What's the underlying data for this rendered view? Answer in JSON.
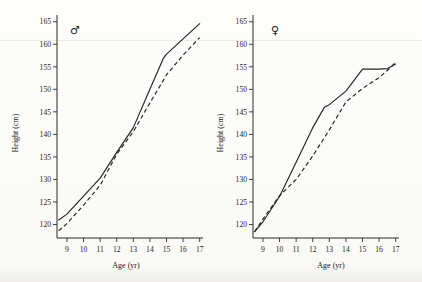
{
  "figure": {
    "background_color": "#fdfdfb",
    "line_color": "#242424"
  },
  "panels": [
    {
      "id": "male",
      "symbol": "♂",
      "symbol_name": "mars-symbol",
      "xlabel": "Age (yr)",
      "ylabel": "Height (cm)",
      "xticks": [
        "9",
        "10",
        "11",
        "12",
        "13",
        "14",
        "15",
        "16",
        "17"
      ],
      "yticks": [
        "120",
        "125",
        "130",
        "135",
        "140",
        "145",
        "150",
        "155",
        "160",
        "165"
      ]
    },
    {
      "id": "female",
      "symbol": "♀",
      "symbol_name": "venus-symbol",
      "xlabel": "Age (yr)",
      "ylabel": "Height (cm)",
      "xticks": [
        "9",
        "10",
        "11",
        "12",
        "13",
        "14",
        "15",
        "16",
        "17"
      ],
      "yticks": [
        "120",
        "125",
        "130",
        "135",
        "140",
        "145",
        "150",
        "155",
        "160",
        "165"
      ]
    }
  ],
  "chart_data": [
    {
      "type": "line",
      "title": "Male growth curve",
      "panel": "male",
      "symbol": "♂",
      "xlabel": "Age (yr)",
      "ylabel": "Height (cm)",
      "xlim": [
        8.4,
        17.2
      ],
      "ylim": [
        117.0,
        166.5
      ],
      "xticks": [
        9,
        10,
        11,
        12,
        13,
        14,
        15,
        16,
        17
      ],
      "yticks": [
        120,
        125,
        130,
        135,
        140,
        145,
        150,
        155,
        160,
        165
      ],
      "grid": false,
      "legend": "none",
      "series": [
        {
          "name": "solid",
          "style": "solid",
          "x": [
            8.5,
            9,
            10,
            11,
            12,
            13,
            14,
            14.8,
            15,
            16,
            17
          ],
          "values": [
            121.0,
            122.3,
            126.3,
            130.3,
            136.0,
            141.5,
            150.0,
            156.8,
            157.8,
            161.2,
            164.6
          ]
        },
        {
          "name": "dashed",
          "style": "dashed",
          "x": [
            8.5,
            9,
            10,
            11,
            12,
            13,
            14,
            15,
            16,
            17
          ],
          "values": [
            118.6,
            120.2,
            124.3,
            128.7,
            135.6,
            140.6,
            147.0,
            153.2,
            157.6,
            161.5
          ]
        }
      ]
    },
    {
      "type": "line",
      "title": "Female growth curve",
      "panel": "female",
      "symbol": "♀",
      "xlabel": "Age (yr)",
      "ylabel": "Height (cm)",
      "xlim": [
        8.4,
        17.2
      ],
      "ylim": [
        117.0,
        166.5
      ],
      "xticks": [
        9,
        10,
        11,
        12,
        13,
        14,
        15,
        16,
        17
      ],
      "yticks": [
        120,
        125,
        130,
        135,
        140,
        145,
        150,
        155,
        160,
        165
      ],
      "grid": false,
      "legend": "none",
      "series": [
        {
          "name": "solid",
          "style": "solid",
          "x": [
            8.5,
            9,
            10,
            11,
            12,
            12.7,
            13,
            14,
            15,
            16,
            16.5,
            17
          ],
          "values": [
            118.4,
            120.6,
            126.2,
            133.8,
            141.5,
            146.0,
            146.6,
            149.6,
            154.5,
            154.5,
            154.6,
            155.6
          ]
        },
        {
          "name": "dashed",
          "style": "dashed",
          "x": [
            8.5,
            9,
            10,
            11,
            12,
            13,
            14,
            15,
            16,
            16.8,
            17
          ],
          "values": [
            118.4,
            121.2,
            126.4,
            130.0,
            135.2,
            141.0,
            147.2,
            150.2,
            152.6,
            155.2,
            156.2
          ]
        }
      ]
    }
  ]
}
